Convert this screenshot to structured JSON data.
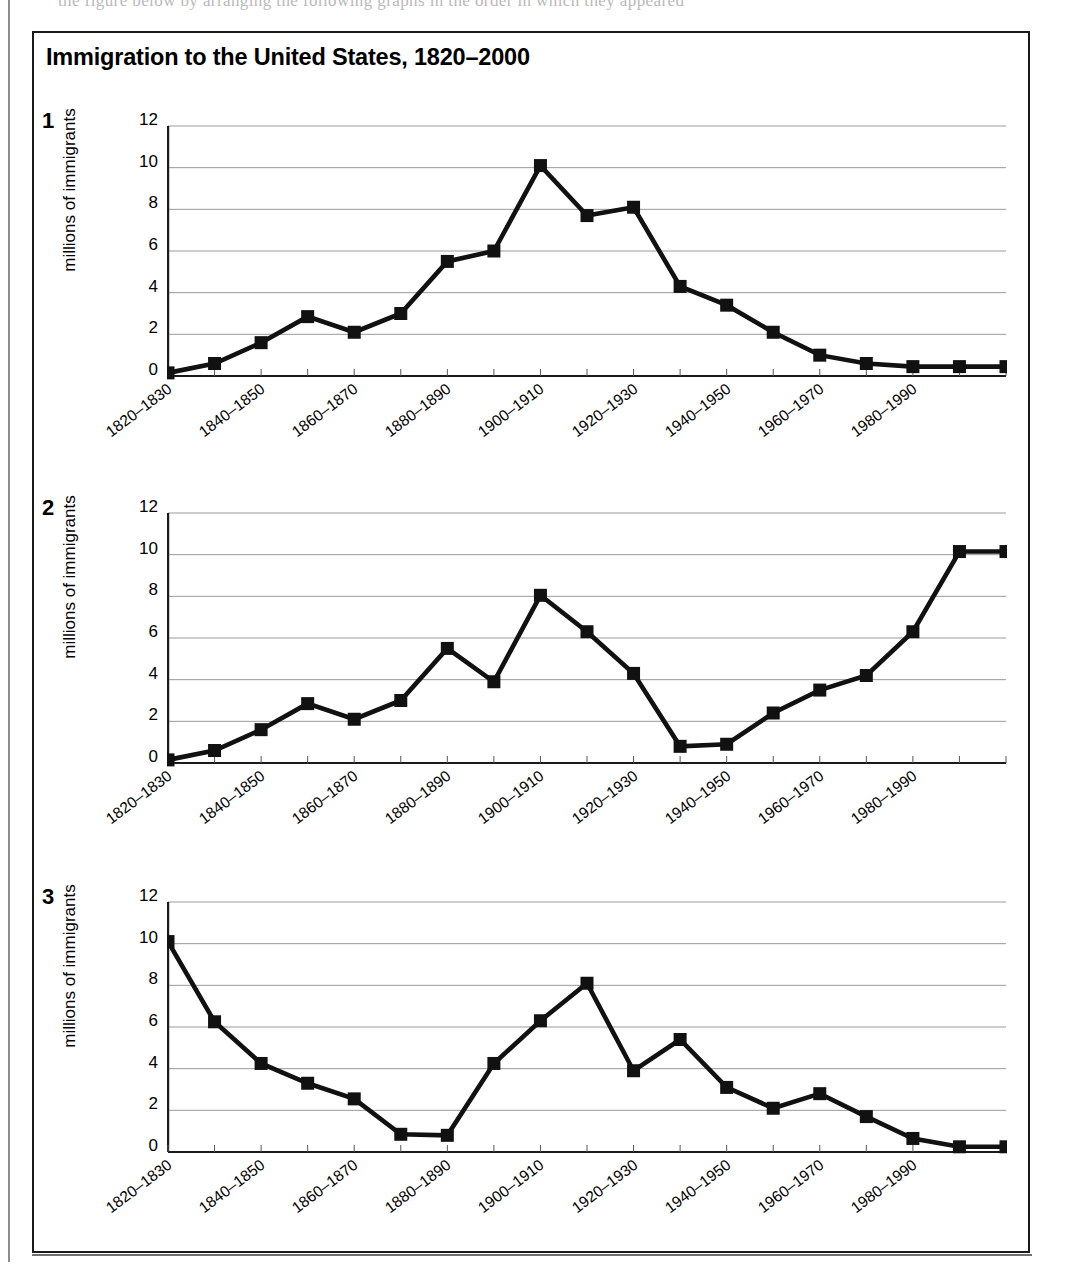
{
  "page": {
    "ghost_text": "the figure below by arranging the following graphs in the order in which they appeared"
  },
  "figure": {
    "title": "Immigration to the United States, 1820–2000"
  },
  "axis": {
    "ylabel": "millions of immigrants",
    "yticks": [
      0,
      2,
      4,
      6,
      8,
      10,
      12
    ],
    "ymin": 0,
    "ymax": 12,
    "xtick_labels": [
      "1820–1830",
      "1840–1850",
      "1860–1870",
      "1880–1890",
      "1900–1910",
      "1920–1930",
      "1940–1950",
      "1960–1970",
      "1980–1990"
    ]
  },
  "panels": [
    {
      "index": "1"
    },
    {
      "index": "2"
    },
    {
      "index": "3"
    }
  ],
  "chart_data": [
    {
      "type": "line",
      "panel": "1",
      "title": "Immigration to the United States, 1820–2000",
      "xlabel": "",
      "ylabel": "millions of immigrants",
      "ylim": [
        0,
        12
      ],
      "grid": true,
      "legend": "none",
      "marker": "filled-square",
      "categories": [
        "1820–1830",
        "1830–1840",
        "1840–1850",
        "1850–1860",
        "1860–1870",
        "1870–1880",
        "1880–1890",
        "1890–1900",
        "1900–1910",
        "1910–1920",
        "1920–1930",
        "1930–1940",
        "1940–1950",
        "1950–1960",
        "1960–1970",
        "1970–1980",
        "1980–1990",
        "1990–2000",
        "2000–2010"
      ],
      "values": [
        0.15,
        0.6,
        1.6,
        2.85,
        2.1,
        3.0,
        5.5,
        6.0,
        10.1,
        7.7,
        8.1,
        4.3,
        3.4,
        2.1,
        1.0,
        0.6,
        0.45,
        0.45,
        0.45
      ]
    },
    {
      "type": "line",
      "panel": "2",
      "title": "Immigration to the United States, 1820–2000",
      "xlabel": "",
      "ylabel": "millions of immigrants",
      "ylim": [
        0,
        12
      ],
      "grid": true,
      "legend": "none",
      "marker": "filled-square",
      "categories": [
        "1820–1830",
        "1830–1840",
        "1840–1850",
        "1850–1860",
        "1860–1870",
        "1870–1880",
        "1880–1890",
        "1890–1900",
        "1900–1910",
        "1910–1920",
        "1920–1930",
        "1930–1940",
        "1940–1950",
        "1950–1960",
        "1960–1970",
        "1970–1980",
        "1980–1990",
        "1990–2000",
        "2000–2010"
      ],
      "values": [
        0.15,
        0.6,
        1.6,
        2.85,
        2.1,
        3.0,
        5.5,
        3.9,
        8.05,
        6.3,
        4.3,
        0.8,
        0.9,
        2.4,
        3.5,
        4.2,
        6.3,
        10.15,
        10.15
      ]
    },
    {
      "type": "line",
      "panel": "3",
      "title": "Immigration to the United States, 1820–2000",
      "xlabel": "",
      "ylabel": "millions of immigrants",
      "ylim": [
        0,
        12
      ],
      "grid": true,
      "legend": "none",
      "marker": "filled-square",
      "categories": [
        "1820–1830",
        "1830–1840",
        "1840–1850",
        "1850–1860",
        "1860–1870",
        "1870–1880",
        "1880–1890",
        "1890–1900",
        "1900–1910",
        "1910–1920",
        "1920–1930",
        "1930–1940",
        "1940–1950",
        "1950–1960",
        "1960–1970",
        "1970–1980",
        "1980–1990",
        "1990–2000",
        "2000–2010"
      ],
      "values": [
        10.1,
        6.25,
        4.25,
        3.3,
        2.55,
        0.85,
        0.8,
        4.25,
        6.3,
        8.1,
        3.9,
        5.4,
        3.1,
        2.1,
        2.8,
        1.7,
        0.65,
        0.25,
        0.25
      ]
    }
  ],
  "colors": {
    "line": "#111111",
    "marker": "#111111",
    "grid": "#9a9a9a",
    "axis": "#1a1a1a",
    "frame": "#1a1a1a"
  }
}
